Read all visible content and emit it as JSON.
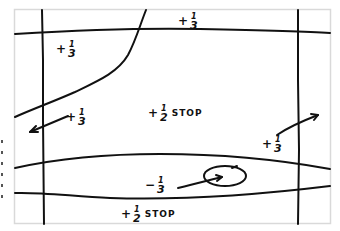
{
  "diagram": {
    "type": "hand-drawn exposure zone sketch",
    "frame_color": "#d9d9d9",
    "line_color": "#111111",
    "labels": [
      {
        "id": "top",
        "sign": "+",
        "num": "1",
        "den": "3",
        "word": ""
      },
      {
        "id": "upper-left",
        "sign": "+",
        "num": "1",
        "den": "3",
        "word": ""
      },
      {
        "id": "mid-left",
        "sign": "+",
        "num": "1",
        "den": "3",
        "word": ""
      },
      {
        "id": "center",
        "sign": "+",
        "num": "1",
        "den": "2",
        "word": "STOP"
      },
      {
        "id": "right",
        "sign": "+",
        "num": "1",
        "den": "3",
        "word": ""
      },
      {
        "id": "lower",
        "sign": "−",
        "num": "1",
        "den": "3",
        "word": ""
      },
      {
        "id": "bottom",
        "sign": "+",
        "num": "1",
        "den": "2",
        "word": "STOP"
      }
    ]
  }
}
